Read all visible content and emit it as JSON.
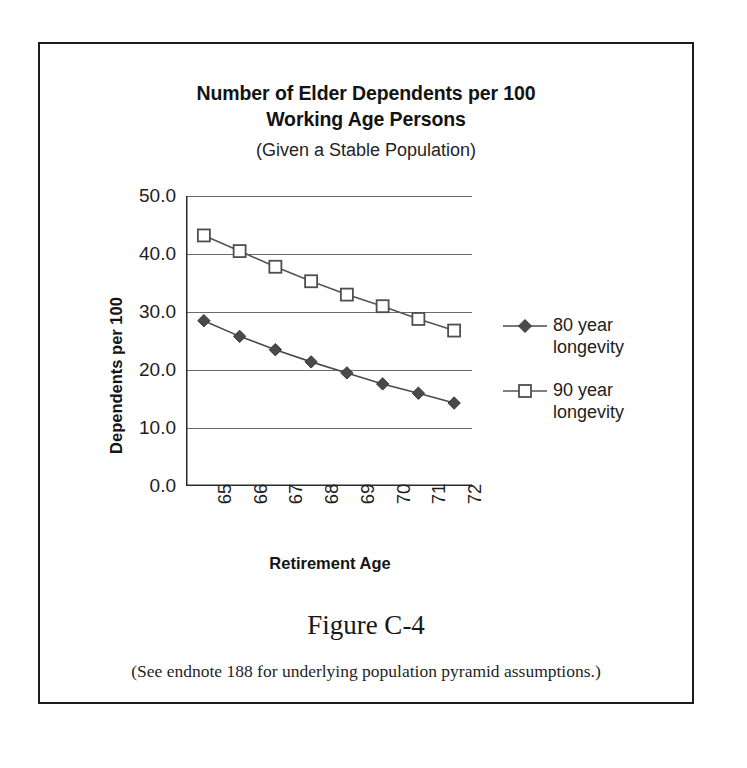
{
  "figure": {
    "title_line1": "Number of Elder Dependents per 100",
    "title_line2": "Working Age Persons",
    "subtitle": "(Given a Stable Population)",
    "caption": "Figure C-4",
    "note": "(See endnote 188 for underlying population pyramid assumptions.)",
    "border_color": "#1c1c1c"
  },
  "chart_data": {
    "type": "line",
    "subtitle": "(Given a Stable Population)",
    "xlabel": "Retirement Age",
    "ylabel": "Dependents per 100",
    "x": [
      65,
      66,
      67,
      68,
      69,
      70,
      71,
      72
    ],
    "categories": [
      "65",
      "66",
      "67",
      "68",
      "69",
      "70",
      "71",
      "72"
    ],
    "xtick_rotation": 90,
    "ylim": [
      0.0,
      50.0
    ],
    "yticks": [
      0.0,
      10.0,
      20.0,
      30.0,
      40.0,
      50.0
    ],
    "ytick_labels": [
      "0.0",
      "10.0",
      "20.0",
      "30.0",
      "40.0",
      "50.0"
    ],
    "grid": "horizontal",
    "legend_position": "right",
    "series": [
      {
        "name": "80 year longevity",
        "marker": "filled-diamond",
        "color": "#4a4a4a",
        "line_color": "#4a4a4a",
        "values": [
          28.5,
          25.8,
          23.5,
          21.4,
          19.5,
          17.6,
          16.0,
          14.3
        ]
      },
      {
        "name": "90 year longevity",
        "marker": "open-square",
        "color": "#ffffff",
        "line_color": "#555555",
        "values": [
          43.2,
          40.5,
          37.8,
          35.3,
          33.0,
          31.0,
          28.8,
          26.8
        ]
      }
    ]
  },
  "legend": {
    "entries": [
      {
        "label_line1": "80 year",
        "label_line2": "longevity"
      },
      {
        "label_line1": "90 year",
        "label_line2": "longevity"
      }
    ]
  }
}
